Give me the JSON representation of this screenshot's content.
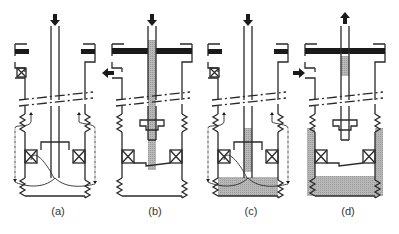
{
  "figure": {
    "type": "well-schematic-sequence",
    "panels": [
      {
        "id": "a",
        "label": "(a)",
        "center_x": 55,
        "top_arrow": "down",
        "side_arrow": "none",
        "tubing_fill": "none",
        "annulus_fill": "none",
        "bottom_fill": "none",
        "flow_paths": true,
        "flange_bar": "split",
        "valve_box": true
      },
      {
        "id": "b",
        "label": "(b)",
        "center_x": 152,
        "top_arrow": "down",
        "side_arrow": "out-left",
        "tubing_fill": "full",
        "annulus_fill": "none",
        "bottom_fill": "none",
        "flow_paths": false,
        "flange_bar": "full",
        "valve_box": false
      },
      {
        "id": "c",
        "label": "(c)",
        "center_x": 248,
        "top_arrow": "down",
        "side_arrow": "none",
        "tubing_fill": "lower",
        "annulus_fill": "none",
        "bottom_fill": "partial",
        "flow_paths": true,
        "flange_bar": "split",
        "valve_box": true
      },
      {
        "id": "d",
        "label": "(d)",
        "center_x": 345,
        "top_arrow": "up",
        "side_arrow": "in-right",
        "tubing_fill": "short",
        "annulus_fill": "outer",
        "bottom_fill": "full",
        "flow_paths": false,
        "flange_bar": "full",
        "valve_box": false
      }
    ]
  },
  "colors": {
    "line": "#2a2a2a",
    "fill": "#b8b8b8",
    "bar": "#1a1a1a"
  }
}
